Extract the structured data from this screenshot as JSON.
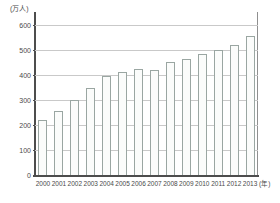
{
  "chart_data": {
    "type": "bar",
    "title": "",
    "xlabel": "年",
    "ylabel": "万人",
    "y_unit_label": "(万人)",
    "x_unit_label": "(年)",
    "categories": [
      "2000",
      "2001",
      "2002",
      "2003",
      "2004",
      "2005",
      "2006",
      "2007",
      "2008",
      "2009",
      "2010",
      "2011",
      "2012",
      "2013"
    ],
    "values": [
      220,
      256,
      300,
      348,
      395,
      412,
      424,
      420,
      452,
      464,
      484,
      500,
      520,
      556
    ],
    "ylim": [
      0,
      620
    ],
    "yticks": [
      0,
      100,
      200,
      300,
      400,
      500,
      600
    ],
    "ytick_labels": [
      "0",
      "100",
      "200",
      "300",
      "400",
      "500",
      "600"
    ],
    "grid": true,
    "legend": "none",
    "bar_fill_color": "#fbfcfb",
    "bar_border_color": "#9aa6a2",
    "grid_color": "#c9c9c9",
    "axis_color": "#4d4d4d"
  }
}
